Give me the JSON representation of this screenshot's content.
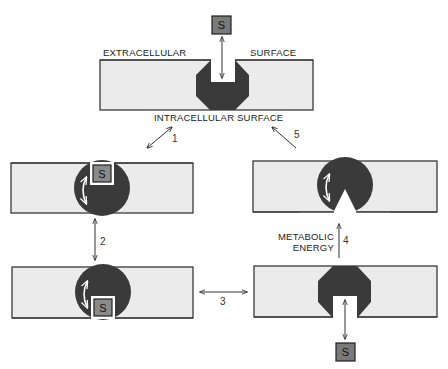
{
  "diagram": {
    "type": "membrane transport cycle",
    "labels": {
      "extracellular": "EXTRACELLULAR",
      "surface_top": "SURFACE",
      "intracellular": "INTRACELLULAR SURFACE",
      "metabolic_1": "METABOLIC",
      "metabolic_2": "ENERGY"
    },
    "substrate_label": "S",
    "steps": [
      "1",
      "2",
      "3",
      "4",
      "5"
    ],
    "colors": {
      "membrane": "#ebebeb",
      "protein": "#3a3a3a",
      "substrate": "#7a7a7a",
      "outline": "#2a2a2a"
    },
    "panels": [
      {
        "id": "top",
        "state": "carrier open to extracellular surface, substrate outside"
      },
      {
        "id": "mid-left",
        "state": "substrate bound, carrier rotating"
      },
      {
        "id": "bottom-left",
        "state": "carrier rotated, substrate facing intracellular side"
      },
      {
        "id": "bottom-right",
        "state": "carrier open to intracellular surface, substrate released"
      },
      {
        "id": "mid-right",
        "state": "empty carrier with notch, rotating back"
      }
    ]
  }
}
